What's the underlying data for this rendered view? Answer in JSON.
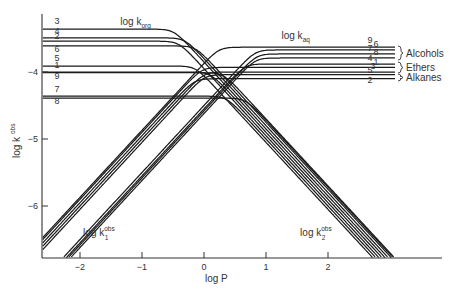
{
  "chart_data": {
    "type": "line",
    "title": "",
    "xlabel": "log P",
    "ylabel": "log k obs",
    "xlim": [
      -2.6,
      3.8
    ],
    "ylim": [
      -6.8,
      -3.2
    ],
    "grid": false,
    "x_ticks": [
      -2,
      -1,
      0,
      1,
      2
    ],
    "y_ticks": [
      -4,
      -5,
      -6
    ],
    "annotations": [
      {
        "text": "log k",
        "sub": "org",
        "sup": "",
        "x": -1.35,
        "y": -3.3
      },
      {
        "text": "log k",
        "sub": "aq",
        "sup": "",
        "x": 1.25,
        "y": -3.5
      },
      {
        "text": "log k",
        "sub": "1",
        "sup": "obs",
        "x": -1.95,
        "y": -6.45
      },
      {
        "text": "log k",
        "sub": "2",
        "sup": "obs",
        "x": 1.55,
        "y": -6.45
      }
    ],
    "groups": [
      {
        "name": "Alcohols",
        "members": [
          9,
          6,
          7,
          8
        ],
        "y": -3.7
      },
      {
        "name": "Ethers",
        "members": [
          4,
          1,
          3
        ],
        "y": -3.9
      },
      {
        "name": "Alkanes",
        "members": [
          5,
          2
        ],
        "y": -4.05
      }
    ],
    "series": [
      {
        "name": "1",
        "log_k_org": -4.0,
        "log_k_aq": -3.93,
        "k1_intercept": -3.3,
        "k2_intercept": -3.9
      },
      {
        "name": "2",
        "log_k_org": -3.54,
        "log_k_aq": -4.1,
        "k1_intercept": -3.35,
        "k2_intercept": -3.95
      },
      {
        "name": "3",
        "log_k_org": -3.36,
        "log_k_aq": -4.0,
        "k1_intercept": -3.4,
        "k2_intercept": -3.85
      },
      {
        "name": "4",
        "log_k_org": -3.49,
        "log_k_aq": -3.88,
        "k1_intercept": -3.95,
        "k2_intercept": -3.8
      },
      {
        "name": "5",
        "log_k_org": -3.91,
        "log_k_aq": -4.04,
        "k1_intercept": -3.45,
        "k2_intercept": -4.05
      },
      {
        "name": "6",
        "log_k_org": -3.61,
        "log_k_aq": -3.67,
        "k1_intercept": -3.9,
        "k2_intercept": -3.75
      },
      {
        "name": "7",
        "log_k_org": -4.36,
        "log_k_aq": -3.73,
        "k1_intercept": -3.98,
        "k2_intercept": -4.0
      },
      {
        "name": "8",
        "log_k_org": -4.39,
        "log_k_aq": -3.79,
        "k1_intercept": -4.02,
        "k2_intercept": -3.72
      },
      {
        "name": "9",
        "log_k_org": -4.01,
        "log_k_aq": -3.63,
        "k1_intercept": -3.27,
        "k2_intercept": -3.7
      }
    ],
    "left_labels": [
      {
        "n": "3",
        "y": -3.28
      },
      {
        "n": "4",
        "y": -3.43
      },
      {
        "n": "2",
        "y": -3.5
      },
      {
        "n": "6",
        "y": -3.7
      },
      {
        "n": "5",
        "y": -3.84
      },
      {
        "n": "1",
        "y": -3.94
      },
      {
        "n": "9",
        "y": -4.1
      },
      {
        "n": "7",
        "y": -4.3
      },
      {
        "n": "8",
        "y": -4.48
      }
    ],
    "right_labels": [
      {
        "n": "9",
        "y": -3.56,
        "dx": 0
      },
      {
        "n": "6",
        "y": -3.62,
        "dx": 6
      },
      {
        "n": "7",
        "y": -3.69,
        "dx": 0
      },
      {
        "n": "8",
        "y": -3.75,
        "dx": 6
      },
      {
        "n": "4",
        "y": -3.84,
        "dx": 0
      },
      {
        "n": "1",
        "y": -3.89,
        "dx": 6
      },
      {
        "n": "3",
        "y": -3.96,
        "dx": 3
      },
      {
        "n": "5",
        "y": -4.01,
        "dx": 0
      },
      {
        "n": "2",
        "y": -4.16,
        "dx": 0
      }
    ]
  },
  "labels": {
    "x_axis_title": "log P",
    "y_axis_title": "log k",
    "y_axis_sup": "obs"
  }
}
